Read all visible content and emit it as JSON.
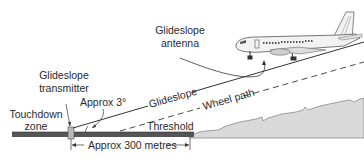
{
  "diagram": {
    "labels": {
      "glideslope_antenna": [
        "Glideslope",
        "antenna"
      ],
      "glideslope_transmitter": [
        "Glideslope",
        "transmitter"
      ],
      "touchdown_zone": [
        "Touchdown",
        "zone"
      ],
      "approx_angle": "Approx 3°",
      "glideslope": "Glideslope",
      "wheel_path": "Wheel path",
      "threshold": "Threshold",
      "approx_distance": "Approx 300 metres"
    },
    "colors": {
      "runway": "#555555",
      "terrain_fill": "#d9d9d9",
      "terrain_edge": "#888888",
      "line": "#333333",
      "transmitter": "#b8b8b8",
      "aircraft": "#f2f2f2"
    }
  }
}
